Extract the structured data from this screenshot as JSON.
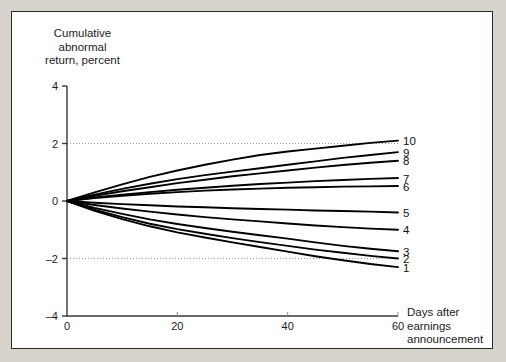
{
  "figure": {
    "background": "#ffffff",
    "page_background": "#d6d3cd",
    "border_color": "#2b2b2b"
  },
  "axes": {
    "y_title": "Cumulative\nabnormal\nreturn, percent",
    "x_title": "Days after\nearnings\nannouncement",
    "y_ticks": [
      "4",
      "2",
      "0",
      "–2",
      "–4"
    ],
    "x_ticks": [
      "0",
      "20",
      "40",
      "60"
    ],
    "gridline_color": "#9a9a9a",
    "axis_color": "#3a3a3a"
  },
  "chart_data": {
    "type": "line",
    "title": "",
    "xlabel": "Days after earnings announcement",
    "ylabel": "Cumulative abnormal return, percent",
    "xlim": [
      0,
      60
    ],
    "ylim": [
      -4,
      4
    ],
    "xticks": [
      0,
      20,
      40,
      60
    ],
    "yticks": [
      -4,
      -2,
      0,
      2,
      4
    ],
    "grid": "horizontal dotted at y = 2 and y = -2",
    "legend": "series labels placed at right end of each line",
    "line_color": "#000000",
    "series": [
      {
        "name": "10",
        "x": [
          0,
          5,
          10,
          15,
          20,
          25,
          30,
          35,
          40,
          45,
          50,
          55,
          60
        ],
        "y": [
          0,
          0.3,
          0.58,
          0.84,
          1.06,
          1.26,
          1.44,
          1.6,
          1.72,
          1.82,
          1.92,
          2.02,
          2.1
        ]
      },
      {
        "name": "9",
        "x": [
          0,
          5,
          10,
          15,
          20,
          25,
          30,
          35,
          40,
          45,
          50,
          55,
          60
        ],
        "y": [
          0,
          0.22,
          0.42,
          0.6,
          0.76,
          0.9,
          1.02,
          1.14,
          1.26,
          1.38,
          1.5,
          1.6,
          1.7
        ]
      },
      {
        "name": "8",
        "x": [
          0,
          5,
          10,
          15,
          20,
          25,
          30,
          35,
          40,
          45,
          50,
          55,
          60
        ],
        "y": [
          0,
          0.18,
          0.34,
          0.48,
          0.62,
          0.74,
          0.86,
          0.96,
          1.06,
          1.16,
          1.25,
          1.33,
          1.4
        ]
      },
      {
        "name": "7",
        "x": [
          0,
          5,
          10,
          15,
          20,
          25,
          30,
          35,
          40,
          45,
          50,
          55,
          60
        ],
        "y": [
          0,
          0.12,
          0.22,
          0.31,
          0.39,
          0.46,
          0.53,
          0.59,
          0.64,
          0.69,
          0.73,
          0.77,
          0.8
        ]
      },
      {
        "name": "6",
        "x": [
          0,
          5,
          10,
          15,
          20,
          25,
          30,
          35,
          40,
          45,
          50,
          55,
          60
        ],
        "y": [
          0,
          0.1,
          0.18,
          0.25,
          0.31,
          0.36,
          0.4,
          0.43,
          0.46,
          0.48,
          0.5,
          0.51,
          0.52
        ]
      },
      {
        "name": "5",
        "x": [
          0,
          5,
          10,
          15,
          20,
          25,
          30,
          35,
          40,
          45,
          50,
          55,
          60
        ],
        "y": [
          0,
          -0.06,
          -0.11,
          -0.15,
          -0.19,
          -0.22,
          -0.25,
          -0.28,
          -0.3,
          -0.33,
          -0.35,
          -0.37,
          -0.4
        ]
      },
      {
        "name": "4",
        "x": [
          0,
          5,
          10,
          15,
          20,
          25,
          30,
          35,
          40,
          45,
          50,
          55,
          60
        ],
        "y": [
          0,
          -0.14,
          -0.26,
          -0.37,
          -0.47,
          -0.56,
          -0.64,
          -0.71,
          -0.78,
          -0.85,
          -0.91,
          -0.96,
          -1.0
        ]
      },
      {
        "name": "3",
        "x": [
          0,
          5,
          10,
          15,
          20,
          25,
          30,
          35,
          40,
          45,
          50,
          55,
          60
        ],
        "y": [
          0,
          -0.24,
          -0.45,
          -0.64,
          -0.8,
          -0.94,
          -1.07,
          -1.19,
          -1.31,
          -1.44,
          -1.56,
          -1.66,
          -1.75
        ]
      },
      {
        "name": "2",
        "x": [
          0,
          5,
          10,
          15,
          20,
          25,
          30,
          35,
          40,
          45,
          50,
          55,
          60
        ],
        "y": [
          0,
          -0.3,
          -0.56,
          -0.79,
          -0.98,
          -1.14,
          -1.29,
          -1.43,
          -1.56,
          -1.69,
          -1.8,
          -1.91,
          -2.0
        ]
      },
      {
        "name": "1",
        "x": [
          0,
          5,
          10,
          15,
          20,
          25,
          30,
          35,
          40,
          45,
          50,
          55,
          60
        ],
        "y": [
          0,
          -0.34,
          -0.63,
          -0.88,
          -1.09,
          -1.27,
          -1.44,
          -1.6,
          -1.76,
          -1.92,
          -2.06,
          -2.19,
          -2.3
        ]
      }
    ]
  }
}
